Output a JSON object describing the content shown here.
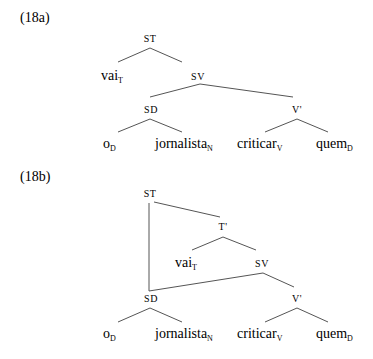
{
  "trees": [
    {
      "label": "(18a)",
      "nodes": {
        "root": "ST",
        "t_head": {
          "base": "vai",
          "sub": "T"
        },
        "sv": "SV",
        "sd": "SD",
        "vbar": "V'",
        "leaves": [
          {
            "base": "o",
            "sub": "D"
          },
          {
            "base": "jornalista",
            "sub": "N"
          },
          {
            "base": "criticar",
            "sub": "V"
          },
          {
            "base": "quem",
            "sub": "D"
          }
        ]
      }
    },
    {
      "label": "(18b)",
      "nodes": {
        "root": "ST",
        "tbar": "T'",
        "t_head": {
          "base": "vai",
          "sub": "T"
        },
        "sv": "SV",
        "sd": "SD",
        "vbar": "V'",
        "leaves": [
          {
            "base": "o",
            "sub": "D"
          },
          {
            "base": "jornalista",
            "sub": "N"
          },
          {
            "base": "criticar",
            "sub": "V"
          },
          {
            "base": "quem",
            "sub": "D"
          }
        ]
      }
    }
  ]
}
